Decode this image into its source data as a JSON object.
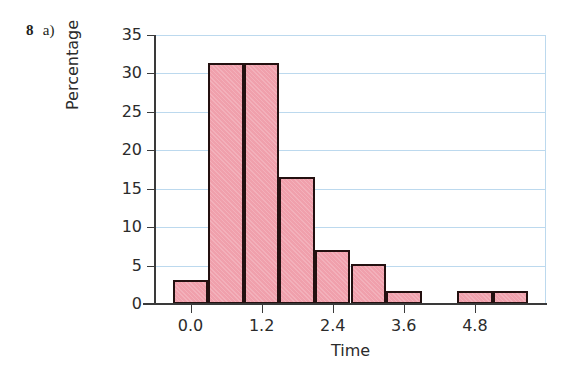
{
  "question": {
    "number": "8",
    "part": "a)"
  },
  "chart_data": {
    "type": "bar",
    "subtype": "histogram",
    "title": "",
    "xlabel": "Time",
    "ylabel": "Percentage",
    "xlim": [
      -0.6,
      6.0
    ],
    "ylim": [
      0,
      35
    ],
    "yticks": [
      0,
      5,
      10,
      15,
      20,
      25,
      30,
      35
    ],
    "ytick_labels": [
      "0",
      "5",
      "10",
      "15",
      "20",
      "25",
      "30",
      "35"
    ],
    "xticks": [
      0.0,
      1.2,
      2.4,
      3.6,
      4.8
    ],
    "xtick_labels": [
      "0.0",
      "1.2",
      "2.4",
      "3.6",
      "4.8"
    ],
    "grid": "horizontal",
    "legend": "none",
    "bin_width": 0.6,
    "bins": [
      {
        "left": -0.3,
        "right": 0.3,
        "value": 3.1
      },
      {
        "left": 0.3,
        "right": 0.9,
        "value": 31.4
      },
      {
        "left": 0.9,
        "right": 1.5,
        "value": 31.4
      },
      {
        "left": 1.5,
        "right": 2.1,
        "value": 16.5
      },
      {
        "left": 2.1,
        "right": 2.7,
        "value": 7.0
      },
      {
        "left": 2.7,
        "right": 3.3,
        "value": 5.2
      },
      {
        "left": 3.3,
        "right": 3.9,
        "value": 1.7
      },
      {
        "left": 3.9,
        "right": 4.5,
        "value": 0.0
      },
      {
        "left": 4.5,
        "right": 5.1,
        "value": 1.7
      },
      {
        "left": 5.1,
        "right": 5.7,
        "value": 1.7
      }
    ],
    "colors": {
      "bar_fill": "#f0a0ac",
      "bar_edge": "#231010",
      "gridline": "#bcd9ee",
      "axis": "#3a3a3a",
      "text": "#2b2b2b",
      "background": "#ffffff"
    }
  }
}
